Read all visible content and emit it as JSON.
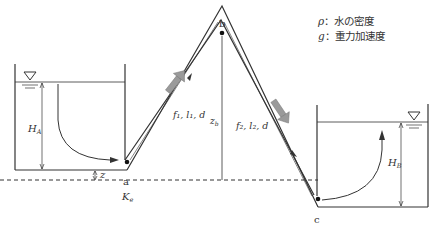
{
  "legend": [
    {
      "symbol": "ρ",
      "sep": "：",
      "text": "水の密度"
    },
    {
      "symbol": "g",
      "sep": "：",
      "text": "重力加速度"
    }
  ],
  "labels": {
    "point_a": "a",
    "point_b": "b",
    "point_c": "c",
    "tank_a_head": "H",
    "tank_a_head_sub": "A",
    "tank_b_head": "H",
    "tank_b_head_sub": "B",
    "elevation_a": "z",
    "elevation_b": "z",
    "elevation_b_sub": "b",
    "entrance_loss": "K",
    "entrance_loss_sub": "e",
    "pipe1": "f₁, l₁, d",
    "pipe2": "f₂, l₂, d"
  },
  "colors": {
    "line": "#333333",
    "flow_arrow": "#9a9a9a"
  }
}
